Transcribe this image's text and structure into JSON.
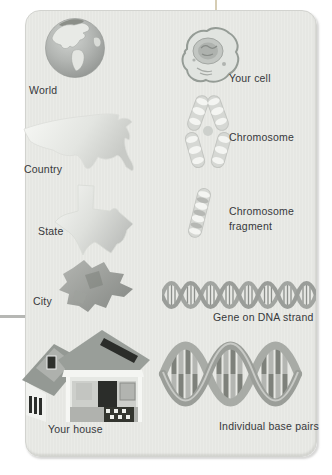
{
  "figure": {
    "palette": {
      "panel_fill": "#e8e9e5",
      "panel_edge": "#d2d3cf",
      "label_text": "#36383b",
      "top_connector_line": "#d6cdb4",
      "left_connector_line": "#b6b7b4",
      "illustration_gray": "#a8aba7",
      "illustration_dark": "#2c2e2b",
      "band_white": "#f4f5f2"
    }
  },
  "columns": {
    "geography": {
      "items": [
        {
          "label": "World",
          "icon": "globe-icon"
        },
        {
          "label": "Country",
          "icon": "usa-map-icon"
        },
        {
          "label": "State",
          "icon": "texas-map-icon"
        },
        {
          "label": "City",
          "icon": "city-map-icon"
        },
        {
          "label": "Your house",
          "icon": "house-icon"
        }
      ]
    },
    "biology": {
      "items": [
        {
          "label": "Your cell",
          "icon": "cell-icon"
        },
        {
          "label": "Chromosome",
          "icon": "chromosome-icon"
        },
        {
          "label": "Chromosome fragment",
          "icon": "chromosome-fragment-icon"
        },
        {
          "label": "Gene on DNA strand",
          "icon": "dna-gene-strand-icon"
        },
        {
          "label": "Individual base pairs",
          "icon": "dna-base-pairs-icon"
        }
      ]
    }
  }
}
